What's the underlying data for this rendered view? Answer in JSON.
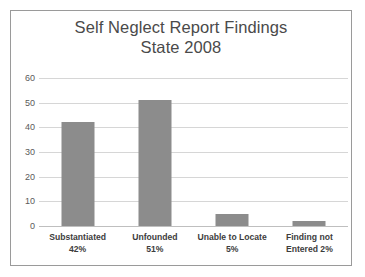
{
  "chart_data": {
    "type": "bar",
    "title": "Self Neglect Report Findings State 2008",
    "title_line1": "Self Neglect Report Findings",
    "title_line2": "State 2008",
    "xlabel": "",
    "ylabel": "",
    "ylim": [
      0,
      60
    ],
    "yticks": [
      "0",
      "10",
      "20",
      "30",
      "40",
      "50",
      "60"
    ],
    "grid": true,
    "legend": "none",
    "bar_color": "#8c8c8c",
    "categories": [
      "Substantiated",
      "Unfounded",
      "Unable to Locate",
      "Finding not Entered"
    ],
    "category_labels": [
      {
        "line1": "Substantiated",
        "line2": "42%"
      },
      {
        "line1": "Unfounded",
        "line2": "51%"
      },
      {
        "line1": "Unable to Locate",
        "line2": "5%"
      },
      {
        "line1": "Finding not",
        "line2": "Entered 2%"
      }
    ],
    "values": [
      42,
      51,
      5,
      2
    ],
    "percent_labels": [
      "42%",
      "51%",
      "5%",
      "2%"
    ]
  }
}
